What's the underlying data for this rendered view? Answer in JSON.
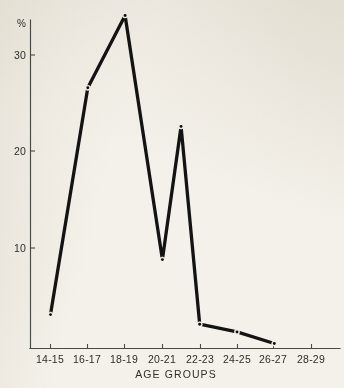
{
  "figure": {
    "background_color": "#f4f1ea",
    "ink_color": "#131313",
    "axis_color": "#4a4a46"
  },
  "chart_data": {
    "type": "line",
    "title": "",
    "subtitle": "",
    "xlabel": "AGE GROUPS",
    "ylabel": "%",
    "categories": [
      "14-15",
      "16-17",
      "18-19",
      "20-21",
      "22-23",
      "24-25",
      "26-27",
      "28-29"
    ],
    "values": [
      3.1,
      26.6,
      34.1,
      8.8,
      2.1,
      1.3,
      0.1,
      null
    ],
    "series": [
      {
        "name": "percent",
        "values": [
          3.1,
          26.6,
          34.1,
          8.8,
          2.1,
          1.3,
          0.1,
          null
        ]
      }
    ],
    "extra_points": [
      {
        "label": "19-20 interpolated",
        "x": 3.5,
        "y": 22.6
      }
    ],
    "ylim": [
      0,
      35.5
    ],
    "xlim": [
      0,
      9
    ],
    "yticks": [
      10,
      20,
      30
    ],
    "ytick_labels": [
      "10",
      "20",
      "30"
    ],
    "grid": false,
    "legend": false,
    "legend_position": "none",
    "markers": "small-dot",
    "line_style": "solid"
  },
  "axes": {
    "y_axis_label": "%",
    "y_tick_labels": [
      "30",
      "20",
      "10"
    ],
    "x_tick_labels": [
      "14-15",
      "16-17",
      "18-19",
      "20-21",
      "22-23",
      "24-25",
      "26-27",
      "28-29"
    ],
    "x_axis_title": "AGE GROUPS"
  }
}
